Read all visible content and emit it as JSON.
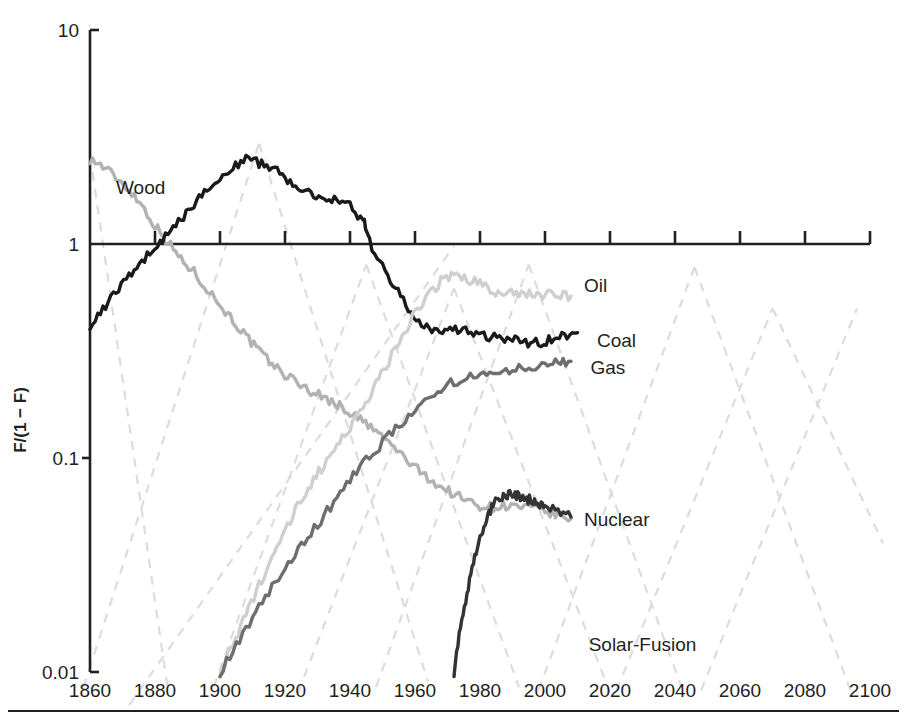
{
  "chart_data": {
    "type": "line",
    "title": "",
    "subtitle": "",
    "xlabel": "",
    "ylabel": "F/(1 − F)",
    "yscale": "log",
    "ylim": [
      0.01,
      10
    ],
    "xlim": [
      1860,
      2100
    ],
    "grid": false,
    "legend_position": "inline-right-of-curve",
    "y_ticks": [
      "10",
      "1",
      "0.1",
      "0.01"
    ],
    "y_tick_values": [
      10,
      1,
      0.1,
      0.01
    ],
    "x_ticks": [
      "1860",
      "1880",
      "1900",
      "1920",
      "1940",
      "1960",
      "1980",
      "2000",
      "2020",
      "2040",
      "2060",
      "2080",
      "2100"
    ],
    "x_tick_values": [
      1860,
      1880,
      1900,
      1920,
      1940,
      1960,
      1980,
      2000,
      2020,
      2040,
      2060,
      2080,
      2100
    ],
    "annotations": [
      {
        "text": "Solar-Fusion",
        "x": 2030,
        "y": 0.0125
      }
    ],
    "series": [
      {
        "name": "Wood",
        "color": "#b2b2b2",
        "label_x": 1868,
        "label_y": 1.85,
        "x": [
          1860,
          1864,
          1868,
          1872,
          1876,
          1880,
          1884,
          1888,
          1892,
          1896,
          1900,
          1904,
          1908,
          1912,
          1916,
          1920,
          1924,
          1928,
          1932,
          1936,
          1940,
          1944,
          1948,
          1952,
          1956,
          1960,
          1964,
          1968,
          1972,
          1976,
          1980,
          1984,
          1988,
          1992,
          1996,
          2000,
          2004,
          2008
        ],
        "y": [
          2.5,
          2.3,
          2.05,
          1.8,
          1.52,
          1.22,
          1.02,
          0.85,
          0.74,
          0.62,
          0.52,
          0.44,
          0.37,
          0.315,
          0.275,
          0.245,
          0.225,
          0.205,
          0.192,
          0.178,
          0.163,
          0.148,
          0.133,
          0.118,
          0.103,
          0.09,
          0.081,
          0.073,
          0.068,
          0.063,
          0.06,
          0.059,
          0.06,
          0.059,
          0.058,
          0.056,
          0.054,
          0.052
        ]
      },
      {
        "name": "Coal",
        "color": "#1a1a1a",
        "label_x": 2016,
        "label_y": 0.355,
        "x": [
          1860,
          1864,
          1868,
          1872,
          1876,
          1880,
          1884,
          1888,
          1892,
          1896,
          1900,
          1904,
          1908,
          1912,
          1916,
          1920,
          1924,
          1928,
          1932,
          1936,
          1940,
          1944,
          1946,
          1950,
          1954,
          1958,
          1962,
          1966,
          1970,
          1974,
          1978,
          1982,
          1986,
          1990,
          1994,
          1998,
          2002,
          2006,
          2010
        ],
        "y": [
          0.42,
          0.5,
          0.6,
          0.72,
          0.84,
          0.96,
          1.1,
          1.3,
          1.55,
          1.8,
          2.05,
          2.3,
          2.5,
          2.4,
          2.25,
          2.05,
          1.88,
          1.75,
          1.62,
          1.66,
          1.5,
          1.3,
          1.02,
          0.78,
          0.62,
          0.5,
          0.425,
          0.39,
          0.385,
          0.4,
          0.385,
          0.365,
          0.365,
          0.355,
          0.345,
          0.345,
          0.36,
          0.375,
          0.385
        ]
      },
      {
        "name": "Oil",
        "color": "#cfcfcf",
        "label_x": 2012,
        "label_y": 0.64,
        "x": [
          1900,
          1904,
          1908,
          1912,
          1916,
          1920,
          1924,
          1928,
          1932,
          1936,
          1940,
          1944,
          1948,
          1952,
          1956,
          1960,
          1964,
          1968,
          1972,
          1976,
          1980,
          1984,
          1988,
          1992,
          1996,
          2000,
          2004,
          2008
        ],
        "y": [
          0.01,
          0.0135,
          0.0185,
          0.0255,
          0.0345,
          0.046,
          0.06,
          0.076,
          0.093,
          0.115,
          0.14,
          0.175,
          0.22,
          0.285,
          0.37,
          0.47,
          0.57,
          0.67,
          0.72,
          0.68,
          0.66,
          0.59,
          0.6,
          0.59,
          0.585,
          0.58,
          0.575,
          0.57
        ]
      },
      {
        "name": "Gas",
        "color": "#6e6e6e",
        "label_x": 2014,
        "label_y": 0.265,
        "x": [
          1900,
          1905,
          1910,
          1915,
          1920,
          1925,
          1930,
          1935,
          1940,
          1945,
          1950,
          1955,
          1960,
          1965,
          1970,
          1975,
          1980,
          1985,
          1990,
          1995,
          2000,
          2004,
          2008
        ],
        "y": [
          0.01,
          0.0135,
          0.018,
          0.0235,
          0.03,
          0.039,
          0.049,
          0.062,
          0.079,
          0.098,
          0.118,
          0.142,
          0.172,
          0.2,
          0.22,
          0.233,
          0.242,
          0.25,
          0.258,
          0.266,
          0.273,
          0.278,
          0.283
        ]
      },
      {
        "name": "Nuclear",
        "color": "#333333",
        "label_x": 2012,
        "label_y": 0.052,
        "x": [
          1972,
          1974,
          1976,
          1978,
          1980,
          1982,
          1984,
          1986,
          1988,
          1990,
          1992,
          1994,
          1996,
          1998,
          2000,
          2004,
          2008
        ],
        "y": [
          0.01,
          0.0165,
          0.023,
          0.032,
          0.043,
          0.053,
          0.06,
          0.065,
          0.0665,
          0.068,
          0.0665,
          0.065,
          0.063,
          0.061,
          0.059,
          0.056,
          0.053
        ]
      }
    ],
    "reference_lines": {
      "style": "dashed",
      "color": "#dcdcdc",
      "note": "logistic substitution straight-line fits on logit scale"
    }
  }
}
